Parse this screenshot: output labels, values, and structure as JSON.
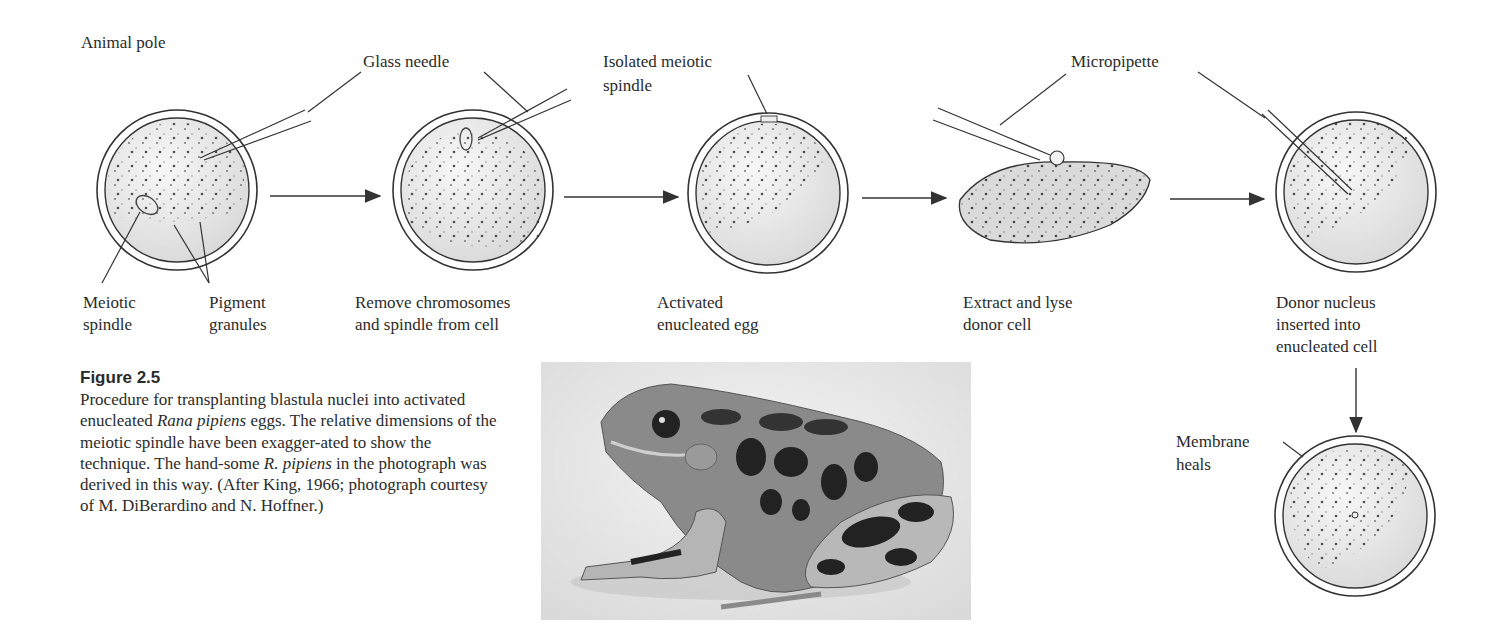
{
  "figure": {
    "number": "Figure 2.5",
    "caption_parts": {
      "p1": "Procedure for transplanting blastula nuclei into activated enucleated ",
      "i1": "Rana pipiens",
      "p2": " eggs. The relative dimensions of the meiotic spindle have been exagger-ated to show the technique. The hand-some ",
      "i2": "R. pipiens",
      "p3": " in the photograph was derived in this way. (After King, 1966; photograph courtesy of M. DiBerardino and N. Hoffner.)"
    }
  },
  "labels": {
    "animal_pole": "Animal pole",
    "glass_needle": "Glass needle",
    "isolated_spindle_1": "Isolated meiotic",
    "isolated_spindle_2": "spindle",
    "micropipette": "Micropipette",
    "meiotic_1": "Meiotic",
    "meiotic_2": "spindle",
    "pigment_1": "Pigment",
    "pigment_2": "granules",
    "membrane_1": "Membrane",
    "membrane_2": "heals"
  },
  "steps": [
    {
      "line1": "Remove chromosomes",
      "line2": "and spindle from cell"
    },
    {
      "line1": "Activated",
      "line2": "enucleated egg"
    },
    {
      "line1": "Extract and lyse",
      "line2": "donor cell"
    },
    {
      "line1": "Donor nucleus",
      "line2": "inserted into",
      "line3": "enucleated cell"
    }
  ],
  "photo": {
    "subject": "Rana pipiens frog photograph"
  },
  "colors": {
    "line": "#333333",
    "egg_fill": "#e6e6e6",
    "text": "#2b2b2b"
  }
}
